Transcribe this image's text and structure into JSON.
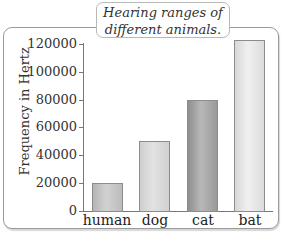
{
  "chart_data": {
    "type": "bar",
    "title": "Hearing ranges of different animals.",
    "title_lines": [
      "Hearing ranges of",
      "different animals."
    ],
    "xlabel": "",
    "ylabel": "Frequency in Hertz",
    "categories": [
      "human",
      "dog",
      "cat",
      "bat"
    ],
    "values": [
      20000,
      50000,
      80000,
      120000
    ],
    "yticks": [
      "0",
      "20000",
      "40000",
      "60000",
      "80000",
      "100000",
      "120000"
    ],
    "ylim": [
      0,
      120000
    ],
    "grid": false,
    "legend": "none",
    "bar_colors": [
      "#c4c4c4",
      "#d6d6d6",
      "#a8a8a8",
      "#e4e4e4"
    ]
  }
}
